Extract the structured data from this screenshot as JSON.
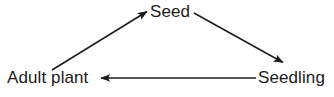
{
  "diagram": {
    "type": "cycle-diagram",
    "background_color": "#ffffff",
    "stroke_color": "#1b1b1b",
    "text_color": "#1b1b1b",
    "nodes": [
      {
        "id": "seed",
        "label": "Seed",
        "position": "top-center"
      },
      {
        "id": "seedling",
        "label": "Seedling",
        "position": "bottom-right"
      },
      {
        "id": "adult-plant",
        "label": "Adult plant",
        "position": "bottom-left"
      }
    ],
    "arrows": [
      {
        "id": "adult-plant-to-seed",
        "from": "adult-plant",
        "to": "seed",
        "direction": "up-right",
        "x1": 52,
        "y1": 70,
        "x2": 148,
        "y2": 11
      },
      {
        "id": "seed-to-seedling",
        "from": "seed",
        "to": "seedling",
        "direction": "down-right",
        "x1": 194,
        "y1": 13,
        "x2": 284,
        "y2": 63
      },
      {
        "id": "seedling-to-adult-plant",
        "from": "seedling",
        "to": "adult-plant",
        "direction": "left",
        "x1": 256,
        "y1": 78,
        "x2": 100,
        "y2": 78
      }
    ]
  }
}
